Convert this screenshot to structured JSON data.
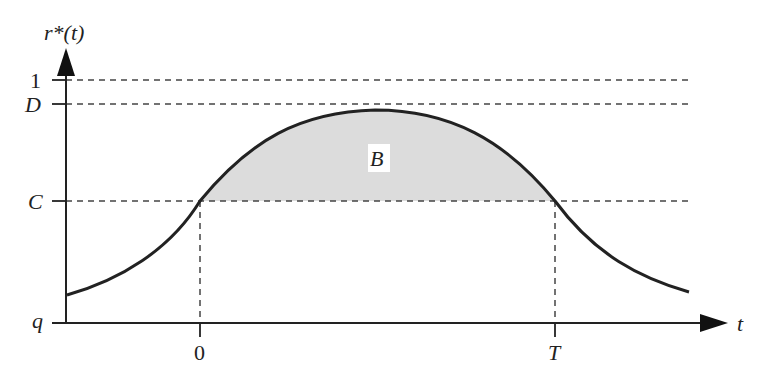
{
  "diagram": {
    "y_axis_label": "r*(t)",
    "x_axis_label": "t",
    "y_ticks": [
      {
        "label": "1",
        "y": 80,
        "italic": false
      },
      {
        "label": "D",
        "y": 104,
        "italic": true
      },
      {
        "label": "C",
        "y": 201,
        "italic": true
      },
      {
        "label": "q",
        "y": 323,
        "italic": true
      }
    ],
    "x_ticks": [
      {
        "label": "0",
        "x": 200,
        "italic": false
      },
      {
        "label": "T",
        "x": 555,
        "italic": true
      }
    ],
    "region_label": "B",
    "colors": {
      "line": "#222222",
      "dashed": "#444444",
      "fill": "#dcdcdc"
    }
  }
}
